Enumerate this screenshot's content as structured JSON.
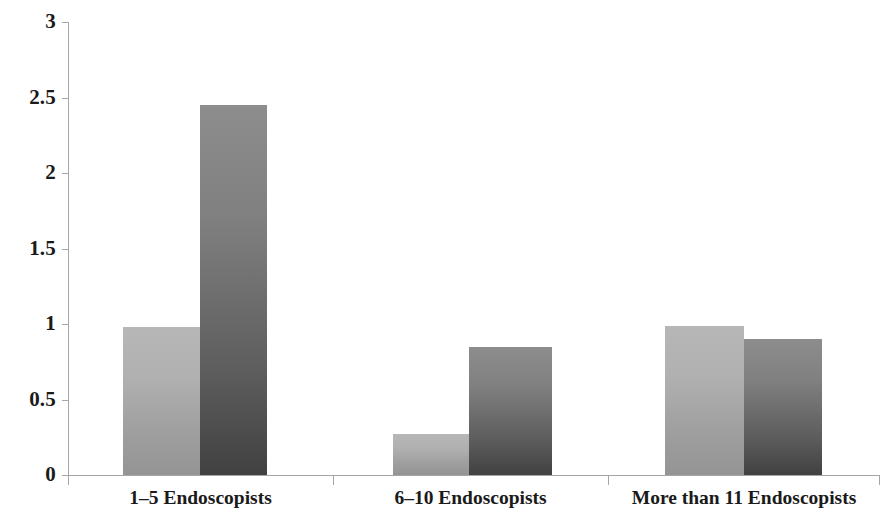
{
  "chart_data": {
    "type": "bar",
    "title": "",
    "subtitle": "",
    "xlabel": "",
    "ylabel": "",
    "categories": [
      "1–5 Endoscopists",
      "6–10 Endoscopists",
      "More than 11 Endoscopists"
    ],
    "series": [
      {
        "name": "Series 1",
        "values": [
          0.98,
          0.27,
          0.99
        ],
        "color": "#b0b0b0"
      },
      {
        "name": "Series 2",
        "values": [
          2.45,
          0.85,
          0.9
        ],
        "color": "#5d5d5d"
      }
    ],
    "ylim": [
      0,
      3
    ],
    "ytick_labels": [
      "3",
      "2.5",
      "2",
      "1.5",
      "1",
      "0.5",
      "0"
    ],
    "ytick_values": [
      3,
      2.5,
      2,
      1.5,
      1,
      0.5,
      0
    ],
    "grid": false,
    "legend": "none",
    "annotations": []
  },
  "axes": {
    "y_axis_name": "value-axis",
    "x_axis_name": "category-axis"
  }
}
